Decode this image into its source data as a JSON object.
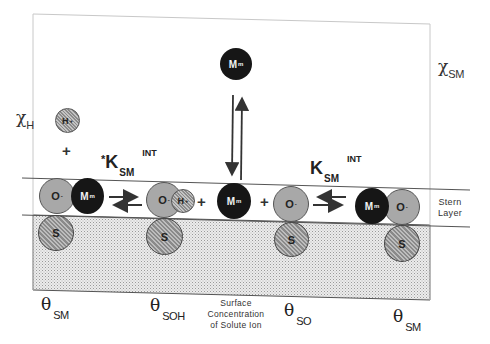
{
  "diagram": {
    "type": "surface-complexation-schematic",
    "region_labels": {
      "stern_layer_line1": "Stern",
      "stern_layer_line2": "Layer",
      "surface_concentration_line1": "Surface",
      "surface_concentration_line2": "Concentration",
      "surface_concentration_line3": "of Solute Ion"
    },
    "bulk_fractions": {
      "chi_h": {
        "symbol": "χ",
        "subscript": "H"
      },
      "chi_sm": {
        "symbol": "χ",
        "subscript": "SM"
      }
    },
    "equilibrium_constants": {
      "left": {
        "prefix": "*",
        "symbol": "K",
        "subscript": "SM",
        "superscript": "INT"
      },
      "right": {
        "prefix": "",
        "symbol": "K",
        "subscript": "SM",
        "superscript": "INT"
      }
    },
    "surface_fractions": [
      {
        "symbol": "θ",
        "subscript": "SM"
      },
      {
        "symbol": "θ",
        "subscript": "SOH"
      },
      {
        "symbol": "θ",
        "subscript": "SO"
      },
      {
        "symbol": "θ",
        "subscript": "SM"
      }
    ],
    "ions": {
      "solution_metal": {
        "label": "M",
        "charge": "m"
      },
      "solution_proton": {
        "label": "H",
        "charge": "+"
      },
      "site1_oxygen": {
        "label": "O",
        "charge": "-"
      },
      "site1_metal": {
        "label": "M",
        "charge": "m"
      },
      "site1_surface": {
        "label": "S"
      },
      "site2_oxygen": {
        "label": "O",
        "charge": "-"
      },
      "site2_proton": {
        "label": "H",
        "charge": "+"
      },
      "site2_surface": {
        "label": "S"
      },
      "free_metal": {
        "label": "M",
        "charge": "m"
      },
      "site3_oxygen": {
        "label": "O",
        "charge": "-"
      },
      "site3_surface": {
        "label": "S"
      },
      "site4_metal": {
        "label": "M",
        "charge": "m"
      },
      "site4_oxygen": {
        "label": "O",
        "charge": "-"
      },
      "site4_surface": {
        "label": "S"
      }
    },
    "operators": {
      "plus": "+"
    },
    "colors": {
      "metal_ion": "#161616",
      "oxygen_ion": "#a8a8a8",
      "surface_site": "#9a9a9a",
      "solid_phase_stipple": "#d6d6d6",
      "lines": "#555555"
    }
  }
}
